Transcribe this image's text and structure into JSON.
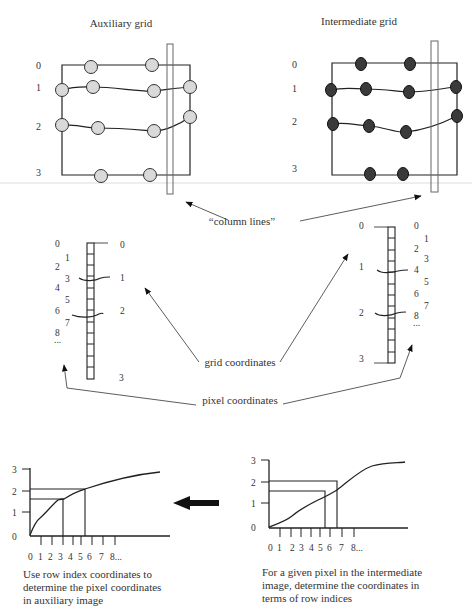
{
  "titles": {
    "auxiliary": "Auxiliary grid",
    "intermediate": "Intermediate grid"
  },
  "grid_row_labels": [
    "0",
    "1",
    "2",
    "3"
  ],
  "annotations": {
    "column_lines": "“column lines”",
    "grid_coordinates": "grid coordinates",
    "pixel_coordinates": "pixel coordinates"
  },
  "left_strip": {
    "pixel_labels_left": [
      "0",
      "1",
      "2",
      "3",
      "4",
      "5",
      "6",
      "7",
      "8",
      "..."
    ],
    "grid_labels_right": [
      "0",
      "1",
      "2",
      "3"
    ]
  },
  "right_strip": {
    "grid_labels_left": [
      "0",
      "1",
      "2",
      "3"
    ],
    "pixel_labels_right": [
      "0",
      "1",
      "2",
      "3",
      "4",
      "5",
      "6",
      "7",
      "8",
      "..."
    ]
  },
  "charts": {
    "left": {
      "y_ticks": [
        "0",
        "1",
        "2",
        "3"
      ],
      "x_ticks": [
        "0",
        "1",
        "2",
        "3",
        "4",
        "5",
        "6",
        "7",
        "8..."
      ],
      "caption": [
        "Use row index coordinates to",
        "determine the pixel coordinates",
        "in auxiliary image"
      ]
    },
    "right": {
      "y_ticks": [
        "0",
        "1",
        "2",
        "3"
      ],
      "x_ticks": [
        "0",
        "1",
        "2",
        "3",
        "4",
        "5",
        "6",
        "7",
        "8..."
      ],
      "caption": [
        "For a given pixel in the intermediate",
        "image, determine the coordinates in",
        "terms of row indices"
      ]
    }
  },
  "colors": {
    "aux_node_fill": "#d9d9d9",
    "inter_node_fill": "#3a3a3a",
    "line": "#222222",
    "divider": "#dddddd"
  }
}
